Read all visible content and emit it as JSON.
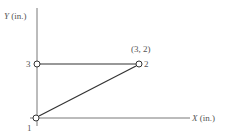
{
  "diagram": {
    "axes": {
      "y_label_var": "Y",
      "y_label_unit": " (in.)",
      "x_label_var": "X",
      "x_label_unit": " (in.)"
    },
    "nodes": [
      {
        "id": "1",
        "label": "1"
      },
      {
        "id": "2",
        "label": "2",
        "coord_label": "(3, 2)"
      },
      {
        "id": "3",
        "label": "3"
      }
    ],
    "members": [
      {
        "from": "3",
        "to": "2"
      },
      {
        "from": "1",
        "to": "2"
      }
    ],
    "colors": {
      "line": "#444444",
      "text": "#555555"
    }
  }
}
